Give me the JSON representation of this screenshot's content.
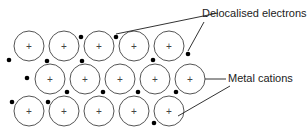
{
  "labels": {
    "electrons": "Delocalised electrons",
    "cations": "Metal cations"
  },
  "cation_symbol": "+",
  "colors": {
    "stroke": "#555555",
    "electron": "#000000"
  },
  "cations": [
    [
      29,
      46
    ],
    [
      64,
      46
    ],
    [
      99,
      46
    ],
    [
      134,
      46
    ],
    [
      169,
      46
    ],
    [
      50,
      79
    ],
    [
      85,
      79
    ],
    [
      120,
      79
    ],
    [
      155,
      79
    ],
    [
      190,
      79
    ],
    [
      29,
      111
    ],
    [
      64,
      111
    ],
    [
      99,
      111
    ],
    [
      134,
      111
    ],
    [
      169,
      111
    ]
  ],
  "electrons": [
    [
      81,
      37
    ],
    [
      116,
      37
    ],
    [
      9,
      60
    ],
    [
      47,
      61
    ],
    [
      82,
      61
    ],
    [
      153,
      60
    ],
    [
      188,
      54
    ],
    [
      27,
      78
    ],
    [
      67,
      92
    ],
    [
      103,
      92
    ],
    [
      138,
      92
    ],
    [
      176,
      92
    ],
    [
      12,
      102
    ],
    [
      48,
      102
    ],
    [
      154,
      123
    ]
  ]
}
